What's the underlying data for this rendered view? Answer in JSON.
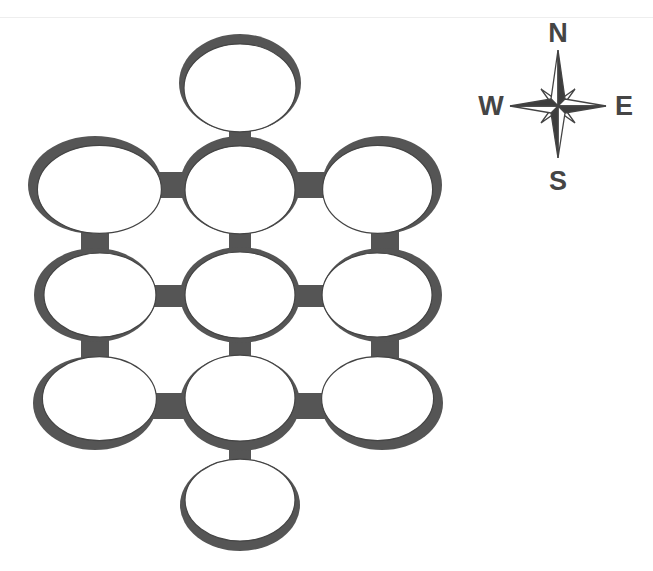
{
  "diagram": {
    "type": "room-map",
    "colors": {
      "wall": "#555555",
      "room_fill": "#ffffff",
      "outline": "#444444",
      "background": "#ffffff"
    },
    "rooms": [
      {
        "id": "north",
        "cx": 240,
        "cy": 83,
        "rx": 57,
        "ry": 45,
        "shadow": "top"
      },
      {
        "id": "nw",
        "cx": 95,
        "cy": 185,
        "rx": 63,
        "ry": 45,
        "shadow": "top-left"
      },
      {
        "id": "n",
        "cx": 240,
        "cy": 185,
        "rx": 56,
        "ry": 45,
        "shadow": "top"
      },
      {
        "id": "ne",
        "cx": 382,
        "cy": 185,
        "rx": 56,
        "ry": 45,
        "shadow": "top-right"
      },
      {
        "id": "w",
        "cx": 95,
        "cy": 295,
        "rx": 57,
        "ry": 43,
        "shadow": "left"
      },
      {
        "id": "center",
        "cx": 240,
        "cy": 295,
        "rx": 56,
        "ry": 44,
        "shadow": "ring"
      },
      {
        "id": "e",
        "cx": 382,
        "cy": 295,
        "rx": 56,
        "ry": 43,
        "shadow": "right"
      },
      {
        "id": "sw",
        "cx": 95,
        "cy": 403,
        "rx": 58,
        "ry": 43,
        "shadow": "bottom-left"
      },
      {
        "id": "s",
        "cx": 240,
        "cy": 403,
        "rx": 56,
        "ry": 44,
        "shadow": "bottom"
      },
      {
        "id": "se",
        "cx": 382,
        "cy": 403,
        "rx": 57,
        "ry": 43,
        "shadow": "bottom-right"
      },
      {
        "id": "south",
        "cx": 240,
        "cy": 505,
        "rx": 56,
        "ry": 42,
        "shadow": "bottom"
      }
    ],
    "corridors": [
      {
        "x": 229,
        "y": 126,
        "w": 22,
        "h": 18
      },
      {
        "x": 155,
        "y": 172,
        "w": 34,
        "h": 26
      },
      {
        "x": 292,
        "y": 172,
        "w": 36,
        "h": 26
      },
      {
        "x": 81,
        "y": 228,
        "w": 28,
        "h": 28
      },
      {
        "x": 229,
        "y": 228,
        "w": 22,
        "h": 26
      },
      {
        "x": 371,
        "y": 228,
        "w": 28,
        "h": 28
      },
      {
        "x": 150,
        "y": 285,
        "w": 36,
        "h": 22
      },
      {
        "x": 293,
        "y": 285,
        "w": 35,
        "h": 22
      },
      {
        "x": 81,
        "y": 336,
        "w": 28,
        "h": 26
      },
      {
        "x": 229,
        "y": 336,
        "w": 22,
        "h": 26
      },
      {
        "x": 371,
        "y": 336,
        "w": 28,
        "h": 26
      },
      {
        "x": 150,
        "y": 393,
        "w": 36,
        "h": 26
      },
      {
        "x": 293,
        "y": 393,
        "w": 35,
        "h": 26
      },
      {
        "x": 229,
        "y": 446,
        "w": 22,
        "h": 20
      }
    ]
  },
  "compass": {
    "icon": "compass-rose-icon",
    "labels": {
      "north": "N",
      "south": "S",
      "east": "E",
      "west": "W"
    }
  }
}
